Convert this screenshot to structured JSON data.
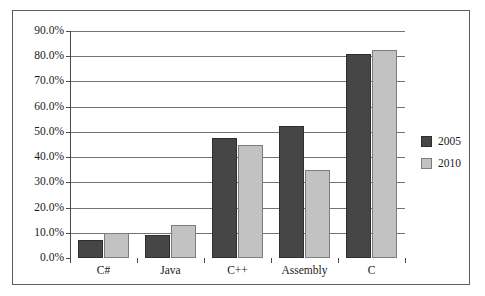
{
  "chart_data": {
    "type": "bar",
    "title": "",
    "subtitle": "",
    "xlabel": "",
    "ylabel": "",
    "categories": [
      "C#",
      "Java",
      "C++",
      "Assembly",
      "C"
    ],
    "series": [
      {
        "name": "2005",
        "color": "#464646",
        "values": [
          7.0,
          9.2,
          47.5,
          52.3,
          81.0
        ]
      },
      {
        "name": "2010",
        "color": "#c2c2c2",
        "values": [
          10.0,
          13.0,
          45.0,
          34.8,
          82.5
        ]
      }
    ],
    "ylim": [
      0,
      90
    ],
    "ytick_values": [
      0,
      10,
      20,
      30,
      40,
      50,
      60,
      70,
      80,
      90
    ],
    "ytick_labels": [
      "0.0%",
      "10.0%",
      "20.0%",
      "30.0%",
      "40.0%",
      "50.0%",
      "60.0%",
      "70.0%",
      "80.0%",
      "90.0%"
    ],
    "grid": true,
    "grid_axis": "y",
    "legend_position": "right",
    "legend_entries": [
      "2005",
      "2010"
    ],
    "plot_background": "#ffffff",
    "gridline_color": "#737373",
    "axis_color": "#4a4a4a",
    "frame_border_color": "#5d5d5d"
  }
}
